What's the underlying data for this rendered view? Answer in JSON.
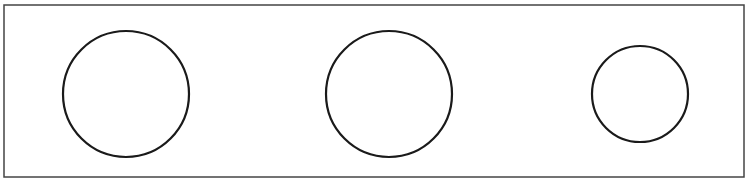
{
  "canvas": {
    "width": 746,
    "height": 187,
    "background": "#ffffff"
  },
  "frame": {
    "x": 4,
    "y": 5,
    "width": 740,
    "height": 172,
    "stroke": "#444444",
    "stroke_width": 1.5
  },
  "circles": [
    {
      "cx": 126,
      "cy": 94,
      "r": 63,
      "stroke": "#1a1a1a",
      "stroke_width": 2.2
    },
    {
      "cx": 389,
      "cy": 94,
      "r": 63,
      "stroke": "#1a1a1a",
      "stroke_width": 2.2
    },
    {
      "cx": 640,
      "cy": 94,
      "r": 48,
      "stroke": "#1a1a1a",
      "stroke_width": 2.2
    }
  ]
}
